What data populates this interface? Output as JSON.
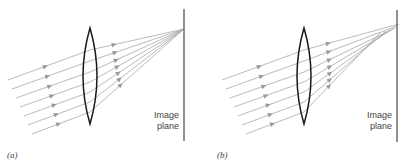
{
  "figure": {
    "type": "ray-optics diagram",
    "panels": [
      {
        "id": "a",
        "panel_label": "(a)",
        "plane_label_line1": "Image",
        "plane_label_line2": "plane",
        "lens": {
          "cx": 90,
          "top": 28,
          "bottom": 124,
          "half_width": 7
        },
        "image_plane": {
          "x": 184,
          "y1": 9,
          "y2": 141
        },
        "focus": {
          "x": 184,
          "y": 29
        },
        "ray_slope": -0.36,
        "rays": [
          {
            "x0": 8,
            "y0": 80,
            "lens_y": 50
          },
          {
            "x0": 12,
            "y0": 89,
            "lens_y": 61
          },
          {
            "x0": 16,
            "y0": 98,
            "lens_y": 72
          },
          {
            "x0": 20,
            "y0": 107,
            "lens_y": 82
          },
          {
            "x0": 24,
            "y0": 116,
            "lens_y": 92
          },
          {
            "x0": 28,
            "y0": 125,
            "lens_y": 102
          },
          {
            "x0": 32,
            "y0": 134,
            "lens_y": 112
          }
        ],
        "focal_points": [
          29,
          29,
          29,
          29,
          29,
          29,
          29
        ],
        "focal_x": [
          184,
          184,
          184,
          184,
          184,
          184,
          184
        ]
      },
      {
        "id": "b",
        "panel_label": "(b)",
        "plane_label_line1": "Image",
        "plane_label_line2": "plane",
        "lens": {
          "cx": 304,
          "top": 28,
          "bottom": 124,
          "half_width": 7
        },
        "image_plane": {
          "x": 397,
          "y1": 10,
          "y2": 142
        },
        "ray_slope": -0.36,
        "rays": [
          {
            "x0": 222,
            "y0": 80,
            "lens_y": 50
          },
          {
            "x0": 226,
            "y0": 89,
            "lens_y": 61
          },
          {
            "x0": 230,
            "y0": 98,
            "lens_y": 72
          },
          {
            "x0": 234,
            "y0": 107,
            "lens_y": 82
          },
          {
            "x0": 238,
            "y0": 116,
            "lens_y": 92
          },
          {
            "x0": 242,
            "y0": 125,
            "lens_y": 102
          },
          {
            "x0": 246,
            "y0": 134,
            "lens_y": 112
          }
        ],
        "focal_points": [
          24,
          26,
          28,
          29,
          30,
          31,
          32
        ],
        "focal_x": [
          399,
          397,
          395,
          393,
          390,
          386,
          381
        ]
      }
    ],
    "caption_concept": "Parallel rays through a converging lens: (a) ideal focus on image plane, (b) spherical aberration"
  },
  "colors": {
    "ray": "#a8a8a8",
    "arrow": "#9a9a9a",
    "lens": "#1a1a1a",
    "plane": "#555555",
    "text": "#444444"
  }
}
